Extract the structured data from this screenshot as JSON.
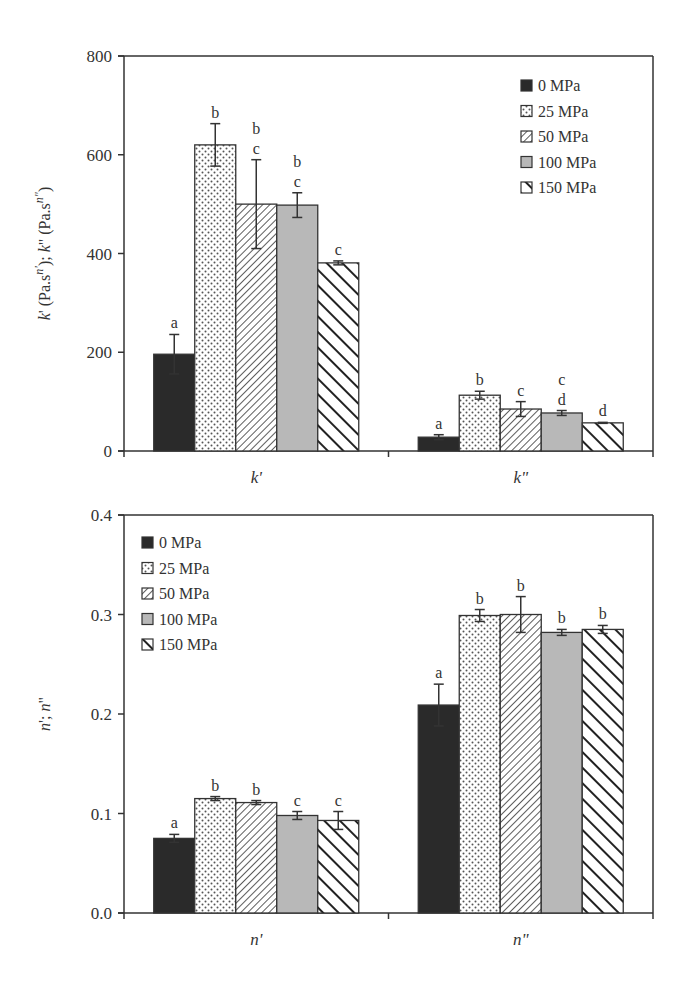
{
  "chart_data": [
    {
      "type": "bar",
      "title": "",
      "xlabel": "",
      "ylabel": "k' (Pa.s^n'); k\" (Pa.s^n\")",
      "ylim": [
        0,
        800
      ],
      "yticks": [
        0,
        200,
        400,
        600,
        800
      ],
      "grid": false,
      "legend_position": "upper right",
      "categories": [
        "k'",
        "k\""
      ],
      "series": [
        {
          "name": "0 MPa",
          "values": [
            196,
            28
          ],
          "errors": [
            40,
            5
          ],
          "letters": [
            "a",
            "a"
          ]
        },
        {
          "name": "25 MPa",
          "values": [
            620,
            113
          ],
          "errors": [
            43,
            8
          ],
          "letters": [
            "b",
            "b"
          ]
        },
        {
          "name": "50 MPa",
          "values": [
            500,
            85
          ],
          "errors": [
            90,
            15
          ],
          "letters": [
            "b c",
            "c"
          ]
        },
        {
          "name": "100 MPa",
          "values": [
            498,
            77
          ],
          "errors": [
            25,
            5
          ],
          "letters": [
            "b c",
            "c d"
          ]
        },
        {
          "name": "150 MPa",
          "values": [
            381,
            57
          ],
          "errors": [
            4,
            1
          ],
          "letters": [
            "c",
            "d"
          ]
        }
      ]
    },
    {
      "type": "bar",
      "title": "",
      "xlabel": "",
      "ylabel": "n'; n\"",
      "ylim": [
        0,
        0.4
      ],
      "yticks": [
        0.0,
        0.1,
        0.2,
        0.3,
        0.4
      ],
      "grid": false,
      "legend_position": "upper left",
      "categories": [
        "n'",
        "n\""
      ],
      "series": [
        {
          "name": "0 MPa",
          "values": [
            0.075,
            0.209
          ],
          "errors": [
            0.004,
            0.021
          ],
          "letters": [
            "a",
            "a"
          ]
        },
        {
          "name": "25 MPa",
          "values": [
            0.115,
            0.299
          ],
          "errors": [
            0.002,
            0.006
          ],
          "letters": [
            "b",
            "b"
          ]
        },
        {
          "name": "50 MPa",
          "values": [
            0.111,
            0.3
          ],
          "errors": [
            0.002,
            0.018
          ],
          "letters": [
            "b",
            "b"
          ]
        },
        {
          "name": "100 MPa",
          "values": [
            0.098,
            0.282
          ],
          "errors": [
            0.004,
            0.003
          ],
          "letters": [
            "c",
            "b"
          ]
        },
        {
          "name": "150 MPa",
          "values": [
            0.093,
            0.285
          ],
          "errors": [
            0.009,
            0.004
          ],
          "letters": [
            "c",
            "b"
          ]
        }
      ]
    }
  ],
  "style": {
    "fills": [
      "#2a2a2a",
      "dots",
      "fine-hatch",
      "#b8b8b8",
      "bold-hatch"
    ],
    "axis_color": "#333333"
  }
}
